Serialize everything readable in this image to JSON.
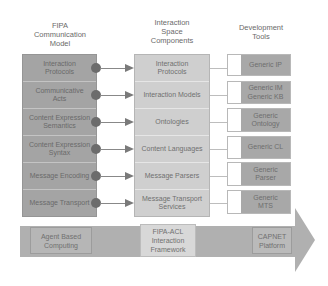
{
  "headers": {
    "left": "FIPA\nCommunication\nModel",
    "left_lines": [
      "FIPA",
      "Communication",
      "Model"
    ],
    "mid_lines": [
      "Interaction",
      "Space",
      "Components"
    ],
    "right_lines": [
      "Development",
      "Tools"
    ]
  },
  "left_column": [
    {
      "label": "Interaction Protocols"
    },
    {
      "label": "Communicative Acts"
    },
    {
      "label": "Content Expression Semantics"
    },
    {
      "label": "Content Expression Syntax"
    },
    {
      "label": "Message Encoding"
    },
    {
      "label": "Message Transport"
    }
  ],
  "mid_column": [
    {
      "label": "Interaction Protocols"
    },
    {
      "label": "Interaction Models"
    },
    {
      "label": "Ontologies"
    },
    {
      "label": "Content Languages"
    },
    {
      "label": "Message Parsers"
    },
    {
      "label": "Message Transport Services"
    }
  ],
  "tools": [
    {
      "label": "Generic IP"
    },
    {
      "label": "Generic IM Generic KB"
    },
    {
      "label": "Generic Ontology"
    },
    {
      "label": "Generic CL"
    },
    {
      "label": "Generic Parser"
    },
    {
      "label": "Generic MTS"
    }
  ],
  "bottom_arrow": [
    {
      "label": "Agent Based Computing"
    },
    {
      "label": "FIPA-ACL Interaction Framework"
    },
    {
      "label": "CAPNET Platform"
    }
  ],
  "colors": {
    "left_fill": "#a4a4a4",
    "mid_fill": "#cfcfcf",
    "tool_fill": "#a8a8a8",
    "arrow_fill": "#b0b0b0",
    "dot": "#6c6c6c"
  }
}
